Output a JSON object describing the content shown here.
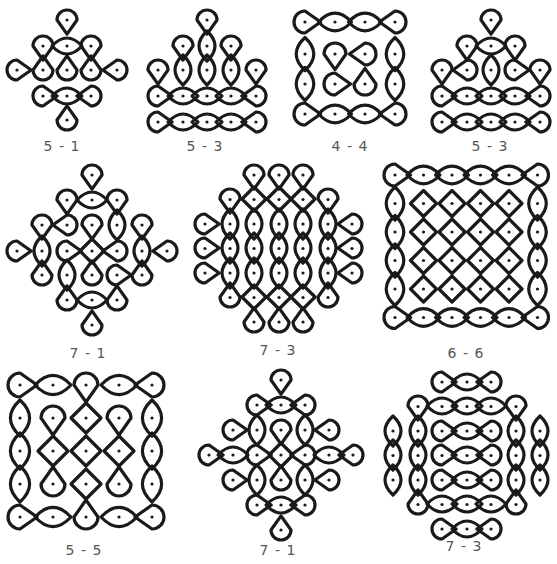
{
  "figures": [
    {
      "id": "f1",
      "label": "5 - 1",
      "grid": "5x5 dots, 1 line",
      "x": 5,
      "y": 8,
      "w": 115,
      "h": 125,
      "label_x": 62,
      "label_y": 138
    },
    {
      "id": "f2",
      "label": "5 - 3",
      "grid": "5x5 dots, 3 lines",
      "x": 148,
      "y": 8,
      "w": 118,
      "h": 125,
      "label_x": 205,
      "label_y": 138
    },
    {
      "id": "f3",
      "label": "4 - 4",
      "grid": "4x4 dots, 4 lines",
      "x": 293,
      "y": 12,
      "w": 112,
      "h": 115,
      "label_x": 350,
      "label_y": 138
    },
    {
      "id": "f4",
      "label": "5 - 3",
      "grid": "5x5 dots, 3 lines",
      "x": 432,
      "y": 8,
      "w": 118,
      "h": 125,
      "label_x": 490,
      "label_y": 138
    },
    {
      "id": "f5",
      "label": "7 - 1",
      "grid": "7x7 dots, 1 line",
      "x": 5,
      "y": 163,
      "w": 170,
      "h": 170,
      "label_x": 88,
      "label_y": 345
    },
    {
      "id": "f6",
      "label": "7 - 3",
      "grid": "7x7 dots, 3 lines",
      "x": 195,
      "y": 163,
      "w": 168,
      "h": 168,
      "label_x": 278,
      "label_y": 342
    },
    {
      "id": "f7",
      "label": "6 - 6",
      "grid": "6x6 dots, 6 lines",
      "x": 383,
      "y": 163,
      "w": 168,
      "h": 168,
      "label_x": 466,
      "label_y": 345
    },
    {
      "id": "f8",
      "label": "5 - 5",
      "grid": "5x5 dots, 5 lines",
      "x": 8,
      "y": 373,
      "w": 155,
      "h": 155,
      "label_x": 84,
      "label_y": 542
    },
    {
      "id": "f9",
      "label": "7 - 1",
      "grid": "7x7 dots, 1 line",
      "x": 195,
      "y": 370,
      "w": 168,
      "h": 168,
      "label_x": 278,
      "label_y": 542
    },
    {
      "id": "f10",
      "label": "7 - 3",
      "grid": "7x7 dots, 3 lines",
      "x": 383,
      "y": 370,
      "w": 168,
      "h": 168,
      "label_x": 464,
      "label_y": 538
    }
  ],
  "colors": {
    "stroke": "#1a1a1a",
    "label": "#555555",
    "background": "#ffffff"
  }
}
